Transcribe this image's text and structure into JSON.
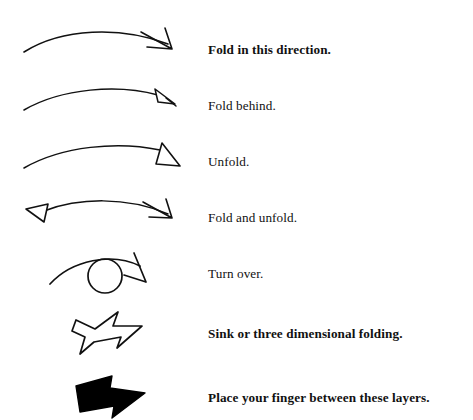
{
  "document": {
    "kind": "origami-symbol-legend",
    "background_color": "#ffffff",
    "ink_color": "#000000"
  },
  "rows": [
    {
      "id": "fold-in-this-direction",
      "symbol_name": "arc-arrow-solid-open-head",
      "symbol_description": "Shallow arc curving left to right ending in a thin open barbed arrowhead pointing down-right.",
      "label": "Fold in this direction.",
      "emphasis": "bold"
    },
    {
      "id": "fold-behind",
      "symbol_name": "arc-arrow-small-hollow-triangle-head",
      "symbol_description": "Shallow arc ending in a small hollow outlined triangle arrowhead.",
      "label": "Fold behind.",
      "emphasis": "normal"
    },
    {
      "id": "unfold",
      "symbol_name": "arc-arrow-large-hollow-triangle-head",
      "symbol_description": "Shallow arc ending in a large hollow outlined triangle arrowhead.",
      "label": "Unfold.",
      "emphasis": "normal"
    },
    {
      "id": "fold-and-unfold",
      "symbol_name": "double-headed-arc-arrow",
      "symbol_description": "Shallow arc with a hollow triangle head at the left end and a thin open barbed head at the right end.",
      "label": "Fold and unfold.",
      "emphasis": "normal"
    },
    {
      "id": "turn-over",
      "symbol_name": "turn-over-loop-arrow",
      "symbol_description": "Arc passing over an open circle, ending in a thin open arrowhead curving down to the right.",
      "label": "Turn over.",
      "emphasis": "normal"
    },
    {
      "id": "sink-or-three-dimensional-folding",
      "symbol_name": "hollow-block-arrow",
      "symbol_description": "Hand drawn hollow block arrow pointing right with a notched concave tail.",
      "label": "Sink or three dimensional folding.",
      "emphasis": "bold"
    },
    {
      "id": "place-your-finger-between-these-layers",
      "symbol_name": "solid-block-arrow",
      "symbol_description": "Solid filled black block arrow pointing right with a notched tail.",
      "label": "Place your finger between these layers.",
      "emphasis": "bold"
    }
  ]
}
